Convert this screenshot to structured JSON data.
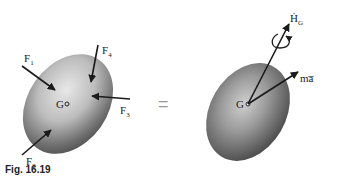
{
  "figure": {
    "caption": "Fig. 16.19",
    "equals_sign": "=",
    "left_body": {
      "center_label": "G",
      "forces": [
        {
          "label": "F",
          "sub": "1"
        },
        {
          "label": "F",
          "sub": "2"
        },
        {
          "label": "F",
          "sub": "3"
        },
        {
          "label": "F",
          "sub": "4"
        }
      ]
    },
    "right_body": {
      "center_label": "G",
      "angular_momentum_rate": {
        "label": "Ḣ",
        "sub": "G"
      },
      "effective_force": {
        "label": "ma̅"
      }
    }
  }
}
